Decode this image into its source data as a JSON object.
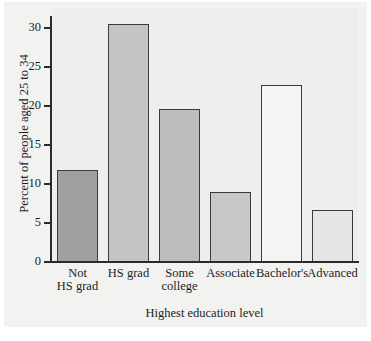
{
  "chart_data": {
    "type": "bar",
    "title": "",
    "xlabel": "Highest education level",
    "ylabel": "Percent of people aged 25 to 34",
    "categories": [
      "Not HS grad",
      "HS grad",
      "Some college",
      "Associate",
      "Bachelor's",
      "Advanced"
    ],
    "category_lines": [
      [
        "Not",
        "HS grad"
      ],
      [
        "HS grad"
      ],
      [
        "Some",
        "college"
      ],
      [
        "Associate"
      ],
      [
        "Bachelor's"
      ],
      [
        "Advanced"
      ]
    ],
    "values": [
      11.8,
      30.5,
      19.6,
      8.9,
      22.7,
      6.7
    ],
    "bar_colors": [
      "#a0a0a0",
      "#c4c4c4",
      "#bdbdbd",
      "#c8c8c8",
      "#f4f4f2",
      "#e6e6e4"
    ],
    "bar_edge_color": "#3a3a3a",
    "ylim": [
      0,
      31.5
    ],
    "yticks": [
      0,
      5,
      10,
      15,
      20,
      25,
      30
    ],
    "ytick_labels": [
      "0",
      "5",
      "10",
      "15",
      "20",
      "25",
      "30"
    ],
    "grid": false,
    "legend": false,
    "plot_background": "#eeeeec",
    "figure_background": "#f2f2f1"
  }
}
